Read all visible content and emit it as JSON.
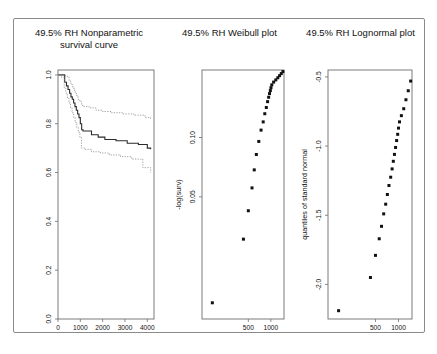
{
  "figure": {
    "background": "#ffffff",
    "frame_color": "#8a8a8a",
    "panel_count": 3
  },
  "chart_data": [
    {
      "type": "line",
      "title": "49.5% RH Nonparametric survival curve",
      "title_line1": "49.5% RH Nonparametric",
      "title_line2": "survival curve",
      "xlabel": "",
      "ylabel": "",
      "xlim": [
        0,
        4300
      ],
      "ylim": [
        0.0,
        1.02
      ],
      "xticks": [
        0,
        1000,
        2000,
        3000,
        4000
      ],
      "xticklabels": [
        "0",
        "1000",
        "2000",
        "3000",
        "4000"
      ],
      "yticks": [
        0.0,
        0.2,
        0.4,
        0.6,
        0.8,
        1.0
      ],
      "yticklabels": [
        "0.0",
        "0.2",
        "0.4",
        "0.6",
        "0.8",
        "1.0"
      ],
      "grid": false,
      "legend": "none",
      "series": [
        {
          "name": "Kaplan-Meier estimate",
          "style": "step-solid",
          "color": "#2b2b2b",
          "x": [
            0,
            180,
            300,
            380,
            450,
            520,
            580,
            640,
            700,
            760,
            820,
            880,
            940,
            1000,
            1060,
            1120,
            1250,
            1500,
            1800,
            2100,
            2600,
            3100,
            3600,
            4000,
            4150
          ],
          "y": [
            1.0,
            1.0,
            0.97,
            0.955,
            0.94,
            0.925,
            0.91,
            0.9,
            0.885,
            0.87,
            0.855,
            0.84,
            0.825,
            0.8,
            0.775,
            0.77,
            0.77,
            0.755,
            0.745,
            0.735,
            0.73,
            0.72,
            0.715,
            0.7,
            0.695
          ]
        },
        {
          "name": "upper 95% confidence limit",
          "style": "step-dotted",
          "color": "#8e8e8e",
          "x": [
            0,
            200,
            330,
            420,
            500,
            580,
            660,
            740,
            820,
            900,
            980,
            1060,
            1150,
            1400,
            1700,
            2000,
            2400,
            2900,
            3400,
            3900,
            4150
          ],
          "y": [
            1.0,
            1.0,
            0.995,
            0.99,
            0.975,
            0.96,
            0.945,
            0.93,
            0.915,
            0.9,
            0.89,
            0.875,
            0.87,
            0.865,
            0.855,
            0.85,
            0.845,
            0.84,
            0.835,
            0.825,
            0.82
          ]
        },
        {
          "name": "lower 95% confidence limit",
          "style": "step-dotted",
          "color": "#8e8e8e",
          "x": [
            0,
            160,
            280,
            350,
            420,
            490,
            560,
            630,
            700,
            770,
            840,
            910,
            980,
            1050,
            1200,
            1500,
            1900,
            2300,
            2800,
            3300,
            3800,
            4150
          ],
          "y": [
            1.0,
            0.99,
            0.945,
            0.925,
            0.905,
            0.885,
            0.865,
            0.845,
            0.825,
            0.805,
            0.785,
            0.765,
            0.745,
            0.7,
            0.695,
            0.685,
            0.68,
            0.672,
            0.665,
            0.655,
            0.62,
            0.6
          ]
        }
      ]
    },
    {
      "type": "scatter",
      "title": "49.5% RH Weibull plot",
      "xlabel": "time",
      "ylabel": "-log(surv)",
      "xlim": [
        120,
        1500
      ],
      "ylim": [
        0.012,
        0.22
      ],
      "xticks": [
        500,
        1000
      ],
      "xticklabels": [
        "500",
        "1000"
      ],
      "yticks": [
        0.05,
        0.1
      ],
      "yticklabels": [
        "0.05",
        "0.10"
      ],
      "x_scale": "log",
      "y_scale": "log",
      "grid": false,
      "legend": "none",
      "marker": "filled-square",
      "points": [
        {
          "time": 165,
          "nlogsurv": 0.0145
        },
        {
          "time": 430,
          "nlogsurv": 0.0305
        },
        {
          "time": 500,
          "nlogsurv": 0.0425
        },
        {
          "time": 560,
          "nlogsurv": 0.0555
        },
        {
          "time": 600,
          "nlogsurv": 0.0685
        },
        {
          "time": 640,
          "nlogsurv": 0.082
        },
        {
          "time": 690,
          "nlogsurv": 0.0955
        },
        {
          "time": 740,
          "nlogsurv": 0.109
        },
        {
          "time": 790,
          "nlogsurv": 0.12
        },
        {
          "time": 830,
          "nlogsurv": 0.132
        },
        {
          "time": 870,
          "nlogsurv": 0.142
        },
        {
          "time": 905,
          "nlogsurv": 0.152
        },
        {
          "time": 935,
          "nlogsurv": 0.16
        },
        {
          "time": 960,
          "nlogsurv": 0.167
        },
        {
          "time": 985,
          "nlogsurv": 0.173
        },
        {
          "time": 1005,
          "nlogsurv": 0.179
        },
        {
          "time": 1030,
          "nlogsurv": 0.185
        },
        {
          "time": 1090,
          "nlogsurv": 0.191
        },
        {
          "time": 1165,
          "nlogsurv": 0.196
        },
        {
          "time": 1240,
          "nlogsurv": 0.201
        },
        {
          "time": 1310,
          "nlogsurv": 0.206
        },
        {
          "time": 1380,
          "nlogsurv": 0.211
        },
        {
          "time": 1450,
          "nlogsurv": 0.216
        }
      ]
    },
    {
      "type": "scatter",
      "title": "49.5% RH Lognormal plot",
      "xlabel": "time",
      "ylabel": "quantiles of standard normal",
      "xlim": [
        120,
        1500
      ],
      "ylim": [
        -2.25,
        -0.45
      ],
      "xticks": [
        500,
        1000
      ],
      "xticklabels": [
        "500",
        "1000"
      ],
      "yticks": [
        -2.0,
        -1.5,
        -1.0,
        -0.5
      ],
      "yticklabels": [
        "-2.0",
        "-1.5",
        "-1.0",
        "-0.5"
      ],
      "x_scale": "log",
      "grid": false,
      "legend": "none",
      "marker": "filled-square",
      "points": [
        {
          "time": 165,
          "quantile": -2.19
        },
        {
          "time": 430,
          "quantile": -1.95
        },
        {
          "time": 500,
          "quantile": -1.79
        },
        {
          "time": 560,
          "quantile": -1.67
        },
        {
          "time": 600,
          "quantile": -1.58
        },
        {
          "time": 640,
          "quantile": -1.49
        },
        {
          "time": 680,
          "quantile": -1.42
        },
        {
          "time": 715,
          "quantile": -1.35
        },
        {
          "time": 750,
          "quantile": -1.285
        },
        {
          "time": 790,
          "quantile": -1.225
        },
        {
          "time": 825,
          "quantile": -1.165
        },
        {
          "time": 855,
          "quantile": -1.11
        },
        {
          "time": 885,
          "quantile": -1.06
        },
        {
          "time": 915,
          "quantile": -1.01
        },
        {
          "time": 945,
          "quantile": -0.96
        },
        {
          "time": 975,
          "quantile": -0.915
        },
        {
          "time": 1000,
          "quantile": -0.87
        },
        {
          "time": 1030,
          "quantile": -0.825
        },
        {
          "time": 1090,
          "quantile": -0.78
        },
        {
          "time": 1170,
          "quantile": -0.73
        },
        {
          "time": 1250,
          "quantile": -0.665
        },
        {
          "time": 1340,
          "quantile": -0.6
        },
        {
          "time": 1440,
          "quantile": -0.53
        }
      ]
    }
  ]
}
